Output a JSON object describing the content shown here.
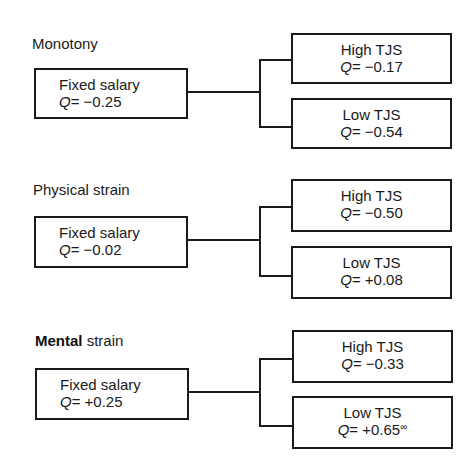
{
  "diagram": {
    "sections": [
      {
        "title_bold": "",
        "title": "Monotony",
        "root": {
          "label": "Fixed salary",
          "q_var": "Q",
          "q_value": "= −0.25"
        },
        "high": {
          "label": "High TJS",
          "q_var": "Q",
          "q_value": "= −0.17",
          "note": ""
        },
        "low": {
          "label": "Low TJS",
          "q_var": "Q",
          "q_value": "= −0.54",
          "note": ""
        }
      },
      {
        "title_bold": "",
        "title": "Physical strain",
        "root": {
          "label": "Fixed salary",
          "q_var": "Q",
          "q_value": "= −0.02"
        },
        "high": {
          "label": "High TJS",
          "q_var": "Q",
          "q_value": "= −0.50",
          "note": ""
        },
        "low": {
          "label": "Low TJS",
          "q_var": "Q",
          "q_value": "= +0.08",
          "note": ""
        }
      },
      {
        "title_bold": "Mental",
        "title": " strain",
        "root": {
          "label": "Fixed salary",
          "q_var": "Q",
          "q_value": "= +0.25"
        },
        "high": {
          "label": "High TJS",
          "q_var": "Q",
          "q_value": "= −0.33",
          "note": ""
        },
        "low": {
          "label": "Low TJS",
          "q_var": "Q",
          "q_value": "= +0.65",
          "note": "∞"
        }
      }
    ]
  }
}
